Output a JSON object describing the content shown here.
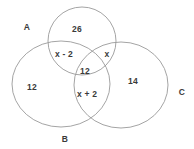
{
  "diagram": {
    "type": "venn-diagram",
    "background_color": "#ffffff",
    "stroke_color": "#9a9a9a",
    "text_color": "#3a3a3a",
    "sets": [
      {
        "id": "A",
        "label": "A",
        "label_x": 27,
        "label_y": 27,
        "shape": "circle",
        "cx": 82,
        "cy": 41,
        "rx": 34,
        "ry": 34
      },
      {
        "id": "B",
        "label": "B",
        "label_x": 65,
        "label_y": 139,
        "shape": "ellipse",
        "cx": 61,
        "cy": 84,
        "rx": 49,
        "ry": 43
      },
      {
        "id": "C",
        "label": "C",
        "label_x": 182,
        "label_y": 92,
        "shape": "ellipse",
        "cx": 121,
        "cy": 85,
        "rx": 47,
        "ry": 43
      }
    ],
    "regions": [
      {
        "id": "A-only",
        "value": "26",
        "x": 77,
        "y": 29
      },
      {
        "id": "A-and-B",
        "value": "x - 2",
        "x": 64,
        "y": 54
      },
      {
        "id": "A-and-C",
        "value": "x",
        "x": 107,
        "y": 54
      },
      {
        "id": "A-and-B-and-C",
        "value": "12",
        "x": 85,
        "y": 71
      },
      {
        "id": "B-and-C",
        "value": "x + 2",
        "x": 87,
        "y": 94
      },
      {
        "id": "B-only",
        "value": "12",
        "x": 32,
        "y": 87
      },
      {
        "id": "C-only",
        "value": "14",
        "x": 133,
        "y": 81
      }
    ]
  }
}
